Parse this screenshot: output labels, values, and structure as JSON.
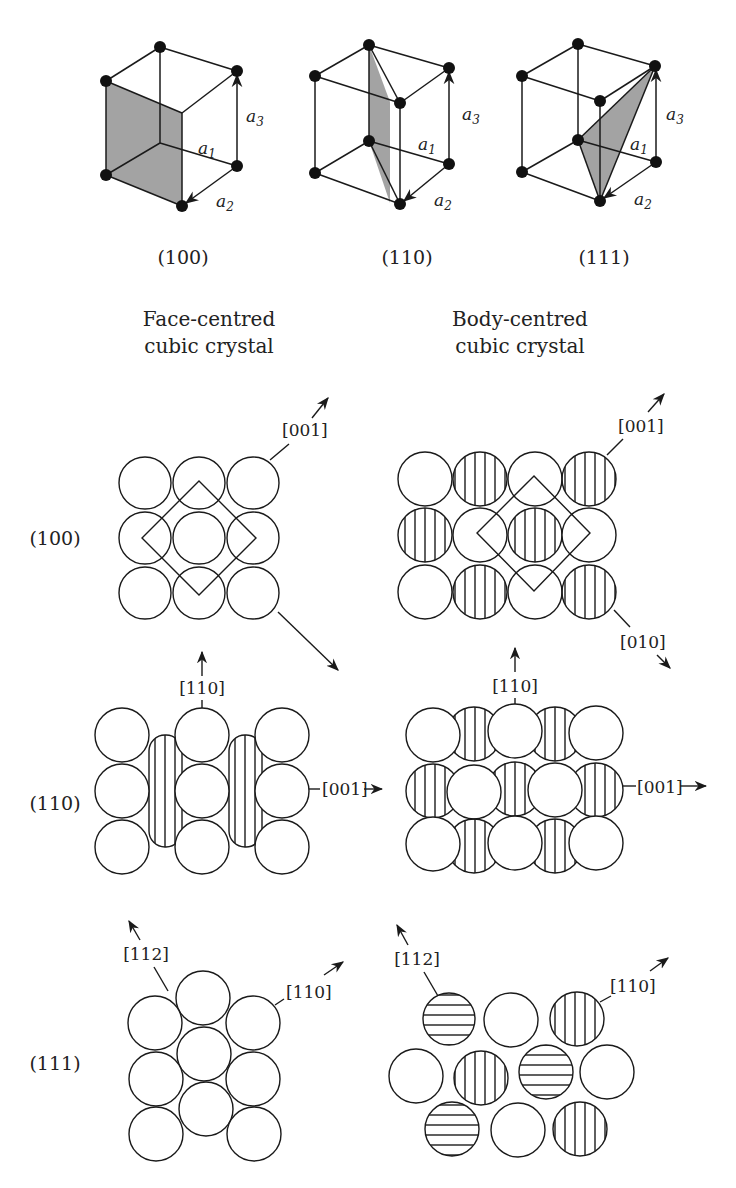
{
  "figure": {
    "type": "crystallography-diagram",
    "colors": {
      "line": "#1a1a1a",
      "plane_fill": "#a3a3a3",
      "background": "#ffffff"
    }
  },
  "unit_cells": [
    {
      "plane": "(100)",
      "caption": "(100)",
      "axes": [
        "a1",
        "a2",
        "a3"
      ],
      "shaded_plane": "front face"
    },
    {
      "plane": "(110)",
      "caption": "(110)",
      "axes": [
        "a1",
        "a2",
        "a3"
      ],
      "shaded_plane": "diagonal vertical plane"
    },
    {
      "plane": "(111)",
      "caption": "(111)",
      "axes": [
        "a1",
        "a2",
        "a3"
      ],
      "shaded_plane": "triangular plane"
    }
  ],
  "axis_labels": {
    "a1": "a",
    "a1_sub": "1",
    "a2": "a",
    "a2_sub": "2",
    "a3": "a",
    "a3_sub": "3"
  },
  "columns": {
    "fcc": {
      "line1": "Face-centred",
      "line2": "cubic crystal"
    },
    "bcc": {
      "line1": "Body-centred",
      "line2": "cubic crystal"
    }
  },
  "rows": [
    {
      "plane": "(100)",
      "fcc": {
        "atoms": "3x3 square grid, all open",
        "directions": [
          "[001]",
          "[010]"
        ]
      },
      "bcc": {
        "atoms": "4x3 grid, alternating hatched (second layer)",
        "directions": [
          "[001]",
          "[010]"
        ]
      }
    },
    {
      "plane": "(110)",
      "fcc": {
        "atoms": "3x3 open with hatched atoms between columns",
        "directions": [
          "[110]",
          "[001]"
        ]
      },
      "bcc": {
        "atoms": "5x3 offset rows, alternating hatched",
        "directions": [
          "[110]",
          "[001]"
        ]
      }
    },
    {
      "plane": "(111)",
      "fcc": {
        "atoms": "close-packed hexagonal, all open",
        "directions": [
          "[112]",
          "[110]"
        ]
      },
      "bcc": {
        "atoms": "open, vertical-hatched and horizontal-hatched layers",
        "directions": [
          "[112]",
          "[110]"
        ]
      }
    }
  ],
  "row_labels": [
    "(100)",
    "(110)",
    "(111)"
  ],
  "direction_labels": {
    "fcc_100_a": "[001]",
    "bcc_100_a": "[001]",
    "bcc_100_b": "[010]",
    "fcc_110_up": "[110]",
    "fcc_110_right": "[001]",
    "bcc_110_up": "[110]",
    "bcc_110_right": "[001]",
    "fcc_111_left": "[112]",
    "fcc_111_right": "[110]",
    "bcc_111_left": "[112]",
    "bcc_111_right": "[110]"
  }
}
